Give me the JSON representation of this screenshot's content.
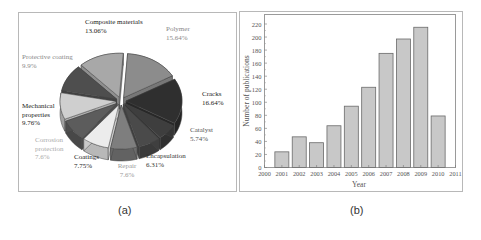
{
  "captions": {
    "a": "(a)",
    "b": "(b)"
  },
  "chart_data": [
    {
      "type": "pie",
      "panel": "(a)",
      "style": "exploded 3D pie",
      "title": "",
      "slices": [
        {
          "label": "Polymer",
          "lines": [
            "Polymer"
          ],
          "value": 15.64,
          "pct_label": "15.64%",
          "color": "#8c8c8c",
          "label_color": "#888888"
        },
        {
          "label": "Cracks",
          "lines": [
            "Cracks"
          ],
          "value": 16.64,
          "pct_label": "16.64%",
          "color": "#2f2f2f",
          "label_color": "#222222"
        },
        {
          "label": "Catalyst",
          "lines": [
            "Catalyst"
          ],
          "value": 5.74,
          "pct_label": "5.74%",
          "color": "#3e3e3e",
          "label_color": "#555555"
        },
        {
          "label": "Encapsulation",
          "lines": [
            "Encapsulation"
          ],
          "value": 6.31,
          "pct_label": "6.31%",
          "color": "#4a4a4a",
          "label_color": "#333333"
        },
        {
          "label": "Repair",
          "lines": [
            "Repair"
          ],
          "value": 7.6,
          "pct_label": "7.6%",
          "color": "#7e7e7e",
          "label_color": "#999999"
        },
        {
          "label": "Coatings",
          "lines": [
            "Coatings"
          ],
          "value": 7.75,
          "pct_label": "7.75%",
          "color": "#ececec",
          "label_color": "#222222"
        },
        {
          "label": "Corrosion protection",
          "lines": [
            "Corrosion",
            "protection"
          ],
          "value": 7.6,
          "pct_label": "7.6%",
          "color": "#5c5c5c",
          "label_color": "#aaaaaa"
        },
        {
          "label": "Mechanical properties",
          "lines": [
            "Mechanical",
            "properties"
          ],
          "value": 9.76,
          "pct_label": "9.76%",
          "color": "#cfcfcf",
          "label_color": "#222222"
        },
        {
          "label": "Protective coating",
          "lines": [
            "Protective coating"
          ],
          "value": 9.9,
          "pct_label": "9.9%",
          "color": "#4e4e4e",
          "label_color": "#888888"
        },
        {
          "label": "Composite materials",
          "lines": [
            "Composite materials"
          ],
          "value": 13.06,
          "pct_label": "13.06%",
          "color": "#a8a8a8",
          "label_color": "#222222"
        }
      ]
    },
    {
      "type": "bar",
      "panel": "(b)",
      "title": "",
      "xlabel": "Year",
      "ylabel": "Number of publications",
      "categories": [
        "2001",
        "2002",
        "2003",
        "2004",
        "2005",
        "2006",
        "2007",
        "2008",
        "2009",
        "2010"
      ],
      "values": [
        24,
        47,
        38,
        64,
        94,
        123,
        175,
        197,
        215,
        79
      ],
      "x_ticks": [
        "2000",
        "2001",
        "2002",
        "2003",
        "2004",
        "2005",
        "2006",
        "2007",
        "2008",
        "2009",
        "2010",
        "2011"
      ],
      "y_ticks": [
        0,
        20,
        40,
        60,
        80,
        100,
        120,
        140,
        160,
        180,
        200,
        220
      ],
      "xlim": [
        2000,
        2011
      ],
      "ylim": [
        0,
        228
      ],
      "grid": false,
      "bar_color": "#c8c8c8",
      "bar_edge_color": "#6a6a6a",
      "legend": "none"
    }
  ]
}
